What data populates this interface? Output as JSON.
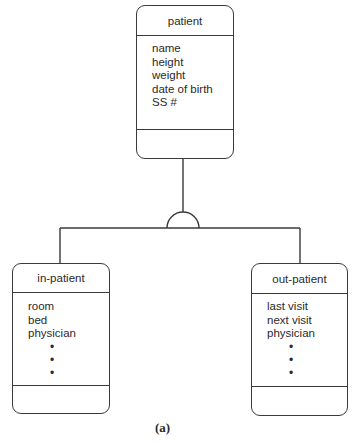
{
  "diagram": {
    "type": "generalization-hierarchy",
    "caption": "(a)",
    "superclass": {
      "name": "patient",
      "attributes": [
        "name",
        "height",
        "weight",
        "date of birth",
        "SS #"
      ],
      "operations": []
    },
    "subclasses": [
      {
        "name": "in-patient",
        "attributes": [
          "room",
          "bed",
          "physician"
        ],
        "ellipsis": [
          "•",
          "•",
          "•"
        ],
        "operations": []
      },
      {
        "name": "out-patient",
        "attributes": [
          "last visit",
          "next visit",
          "physician"
        ],
        "ellipsis": [
          "•",
          "•",
          "•"
        ],
        "operations": []
      }
    ],
    "connector": "semicircle-inheritance-symbol",
    "colors": {
      "line": "#3a3a3a",
      "text": "#2a2a2a",
      "background": "#ffffff"
    }
  }
}
